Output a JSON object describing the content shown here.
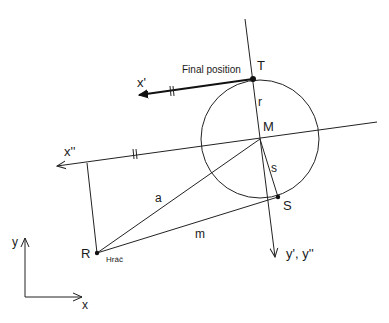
{
  "diagram": {
    "labels": {
      "final_position": "Final position",
      "T": "T",
      "x_prime": "x'",
      "r": "r",
      "M": "M",
      "x_double_prime": "x''",
      "s": "s",
      "S": "S",
      "a": "a",
      "m": "m",
      "R": "R",
      "hrac": "Hráč",
      "y_primes": "y', y''",
      "axis_y": "y",
      "axis_x": "x"
    },
    "points": {
      "T": [
        253,
        79
      ],
      "M": [
        260,
        139
      ],
      "S": [
        278,
        197
      ],
      "R": [
        97,
        253
      ]
    },
    "circle": {
      "center": [
        260,
        139
      ],
      "radius": 59
    },
    "colors": {
      "stroke": "#222222",
      "background": "#ffffff"
    }
  }
}
